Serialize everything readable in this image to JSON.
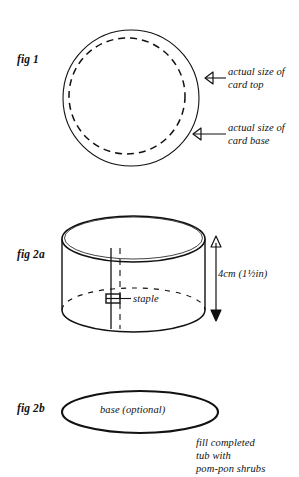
{
  "figures": {
    "fig1": {
      "label": "fig 1",
      "callouts": [
        {
          "name": "card-top",
          "line1": "actual size of",
          "line2": "card top"
        },
        {
          "name": "card-base",
          "line1": "actual size of",
          "line2": "card base"
        }
      ]
    },
    "fig2a": {
      "label": "fig 2a",
      "staple_label": "staple",
      "dimension_label": "4cm (1½in)"
    },
    "fig2b": {
      "label": "fig 2b",
      "base_label": "base (optional)",
      "note": {
        "line1": "fill completed",
        "line2": "tub with",
        "line3": "pom-pon shrubs"
      }
    }
  },
  "colors": {
    "ink": "#111111",
    "page": "#ffffff"
  }
}
